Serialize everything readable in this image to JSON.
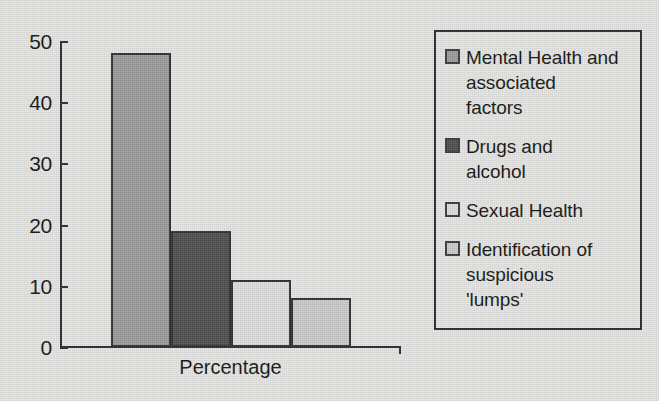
{
  "chart_data": {
    "type": "bar",
    "title": "",
    "subtitle": "",
    "xlabel": "Percentage",
    "ylabel": "",
    "categories": [
      "Mental Health and associated factors",
      "Drugs and alcohol",
      "Sexual Health",
      "Identification of suspicious 'lumps'"
    ],
    "values": [
      48,
      19,
      11,
      8
    ],
    "ylim": [
      0,
      50
    ],
    "y_ticks": [
      0,
      10,
      20,
      30,
      40,
      50
    ],
    "y_tick_labels": [
      "0",
      "10",
      "20",
      "30",
      "40",
      "50"
    ],
    "grid": false,
    "legend_position": "right",
    "series": [
      {
        "name": "Percentage",
        "values": [
          48,
          19,
          11,
          8
        ]
      }
    ],
    "bar_colors": [
      "#9a9a9a",
      "#4e4e4e",
      "#dcdcdc",
      "#c9c9c9"
    ],
    "bar_border_color": "#2f2f2f",
    "axis_color": "#2b2b2b",
    "background_color": "#e4e4e2"
  },
  "axis": {
    "x_title": "Percentage",
    "tick_labels": [
      "50",
      "40",
      "30",
      "20",
      "10",
      "0"
    ]
  },
  "legend": {
    "items": [
      {
        "label": "Mental Health and\nassociated\nfactors",
        "swatch_color": "#9a9a9a",
        "value": 48
      },
      {
        "label": "Drugs and\nalcohol",
        "swatch_color": "#4e4e4e",
        "value": 19
      },
      {
        "label": "Sexual Health",
        "swatch_color": "#dcdcdc",
        "value": 11
      },
      {
        "label": "Identification of\nsuspicious\n'lumps'",
        "swatch_color": "#c9c9c9",
        "value": 8
      }
    ]
  }
}
